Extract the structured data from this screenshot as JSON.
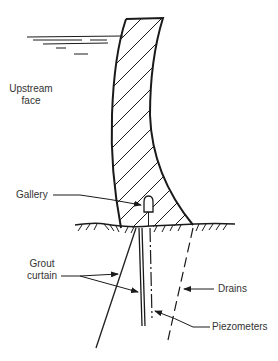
{
  "figure": {
    "colors": {
      "ink": "#1a1a1a",
      "text": "#333333",
      "background": "#ffffff"
    }
  },
  "labels": {
    "upstream_face_line1": "Upstream",
    "upstream_face_line2": "face",
    "gallery": "Gallery",
    "grout_curtain_line1": "Grout",
    "grout_curtain_line2": "curtain",
    "drains": "Drains",
    "piezometers": "Piezometers"
  },
  "elements": {
    "dam_body": "hatched concrete gravity/arch dam section",
    "reservoir": "water surface lines on upstream side",
    "foundation": "ground line with rock hatching",
    "gallery": "inspection gallery near dam base",
    "grout_curtain": "inclined and vertical grout holes",
    "piezometers": "dash-dot vertical line below gallery",
    "drains": "dashed inclined line downstream"
  }
}
